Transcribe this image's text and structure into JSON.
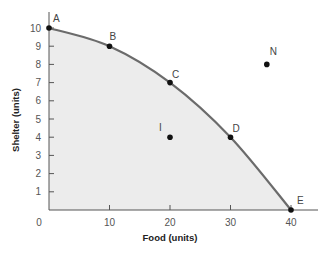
{
  "chart_data": {
    "type": "line",
    "title": "",
    "xlabel": "Food (units)",
    "ylabel": "Shelter (units)",
    "xlim": [
      0,
      44
    ],
    "ylim": [
      0,
      11
    ],
    "x_ticks": [
      0,
      10,
      20,
      30,
      40
    ],
    "y_ticks": [
      1,
      2,
      3,
      4,
      5,
      6,
      7,
      8,
      9,
      10
    ],
    "grid": false,
    "legend": null,
    "colors": {
      "curve": "#6b6b6b",
      "fill": "#ececec",
      "point": "#111111",
      "axis": "#555555"
    },
    "series": [
      {
        "name": "Production possibilities frontier",
        "points": [
          {
            "label": "A",
            "x": 0,
            "y": 10
          },
          {
            "label": "B",
            "x": 10,
            "y": 9
          },
          {
            "label": "C",
            "x": 20,
            "y": 7
          },
          {
            "label": "D",
            "x": 30,
            "y": 4
          },
          {
            "label": "E",
            "x": 40,
            "y": 0
          }
        ]
      }
    ],
    "extra_points": [
      {
        "label": "I",
        "x": 20,
        "y": 4,
        "note": "inside frontier"
      },
      {
        "label": "N",
        "x": 36,
        "y": 8,
        "note": "outside frontier"
      }
    ],
    "shaded_region": "area under frontier"
  }
}
